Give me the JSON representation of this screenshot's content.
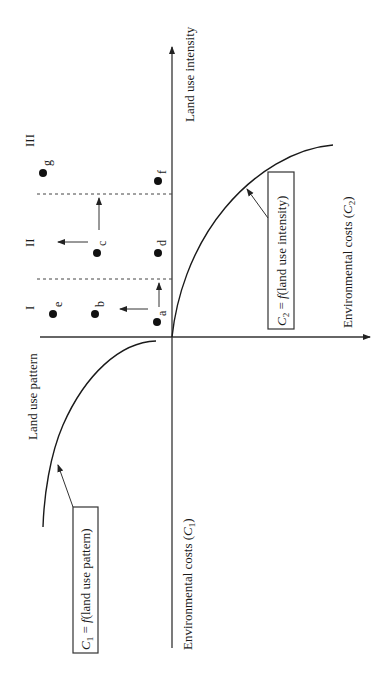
{
  "diagram": {
    "orientation": "rotated 90 degrees counter-clockwise",
    "axes": {
      "land_use_intensity": "Land use intensity",
      "land_use_pattern": "Land use pattern",
      "env_costs_c2": "Environmental costs (",
      "env_costs_c2_sym": "C",
      "env_costs_c2_sub": "2",
      "env_costs_c1": "Environmental costs (",
      "env_costs_c1_sym": "C",
      "env_costs_c1_sub": "1",
      "close_paren": ")"
    },
    "regions": [
      {
        "id": "I",
        "label": "I"
      },
      {
        "id": "II",
        "label": "II"
      },
      {
        "id": "III",
        "label": "III"
      }
    ],
    "points": [
      {
        "id": "a",
        "label": "a"
      },
      {
        "id": "b",
        "label": "b"
      },
      {
        "id": "c",
        "label": "c"
      },
      {
        "id": "d",
        "label": "d"
      },
      {
        "id": "e",
        "label": "e"
      },
      {
        "id": "f",
        "label": "f"
      },
      {
        "id": "g",
        "label": "g"
      }
    ],
    "curves": {
      "c2": {
        "sym": "C",
        "sub": "2",
        "eq": " = ",
        "f": "f",
        "arg": "(land use intensity)"
      },
      "c1": {
        "sym": "C",
        "sub": "1",
        "eq": " = ",
        "f": "f",
        "arg": "(land use pattern)"
      }
    }
  }
}
